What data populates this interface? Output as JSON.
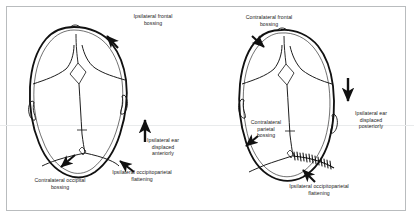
{
  "figure": {
    "background_color": "#ffffff",
    "frame_color": "#b9bcbe",
    "ink_color": "#111111",
    "panels": [
      {
        "id": "left-panel",
        "name": "positional-plagiocephaly-skull",
        "description": "Vertex view of skull, parallelogram shaped",
        "labels": [
          {
            "id": "ipsilateral-frontal-bossing",
            "text": "Ipsilateral frontal\nbossing",
            "arrow": "diagonal-up-right"
          },
          {
            "id": "ipsilateral-ear-displaced-anteriorly",
            "text": "Ipsilateral ear\ndisplaced\nanteriorly",
            "arrow": "up"
          },
          {
            "id": "ipsilateral-occipitoparietal-flattening",
            "text": "Ipsilateral occipitoparietal\nflattening",
            "arrow": "diagonal-up-left"
          },
          {
            "id": "contralateral-occipital-bossing",
            "text": "Contralateral occipital\nbossing",
            "arrow": "diagonal-down-left"
          }
        ]
      },
      {
        "id": "right-panel",
        "name": "lambdoid-craniosynostosis-skull",
        "description": "Vertex view of skull, trapezoid shaped with fused lambdoid suture",
        "labels": [
          {
            "id": "contralateral-frontal-bossing",
            "text": "Contralateral frontal\nbossing",
            "arrow": "diagonal-down-right"
          },
          {
            "id": "ipsilateral-ear-displaced-posteriorly",
            "text": "Ipsilateral ear\ndisplaced\nposteriorly",
            "arrow": "down"
          },
          {
            "id": "contralateral-parietal-bossing",
            "text": "Contralateral\nparietal\nbossing",
            "arrow": "diagonal-down-left"
          },
          {
            "id": "ipsilateral-occipitoparietal-flattening-right",
            "text": "Ipsilateral occipitoparietal\nflattening",
            "arrow": "diagonal-up-left"
          }
        ]
      }
    ]
  },
  "labels": {
    "left_frontal": "Ipsilateral frontal\nbossing",
    "left_ear": "Ipsilateral ear\ndisplaced\nanteriorly",
    "left_flattening": "Ipsilateral occipitoparietal\nflattening",
    "left_occipital": "Contralateral occipital\nbossing",
    "right_frontal": "Contralateral frontal\nbossing",
    "right_ear": "Ipsilateral ear\ndisplaced\nposteriorly",
    "right_parietal": "Contralateral\nparietal\nbossing",
    "right_flattening": "Ipsilateral occipitoparietal\nflattening"
  }
}
